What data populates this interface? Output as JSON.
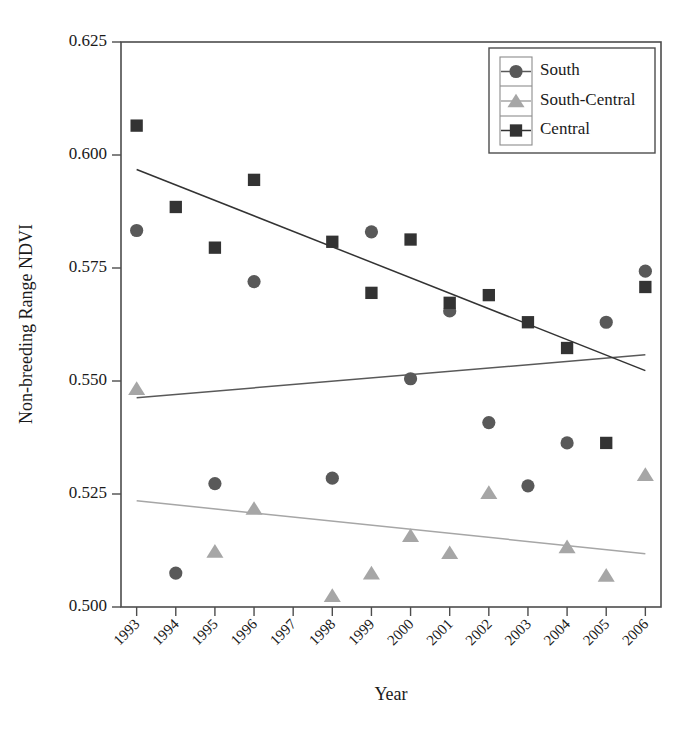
{
  "chart_data": {
    "type": "scatter",
    "title": "",
    "xlabel": "Year",
    "ylabel": "Non-breeding Range NDVI",
    "grid": false,
    "legend_position": "top-right",
    "x": [
      1993,
      1994,
      1995,
      1996,
      1997,
      1998,
      1999,
      2000,
      2001,
      2002,
      2003,
      2004,
      2005,
      2006
    ],
    "xtick_labels": [
      "1993",
      "1994",
      "1995",
      "1996",
      "1997",
      "1998",
      "1999",
      "2000",
      "2001",
      "2002",
      "2003",
      "2004",
      "2005",
      "2006"
    ],
    "xlim": [
      1992.6,
      2006.4
    ],
    "ylim": [
      0.5,
      0.625
    ],
    "ytick_values": [
      0.5,
      0.525,
      0.55,
      0.575,
      0.6,
      0.625
    ],
    "ytick_labels": [
      "0.500",
      "0.525",
      "0.550",
      "0.575",
      "0.600",
      "0.625"
    ],
    "series": [
      {
        "name": "South",
        "marker": "circle",
        "color": "#595959",
        "points": [
          {
            "x": 1993,
            "y": 0.5833
          },
          {
            "x": 1994,
            "y": 0.5075
          },
          {
            "x": 1995,
            "y": 0.5273
          },
          {
            "x": 1996,
            "y": 0.572
          },
          {
            "x": 1998,
            "y": 0.5285
          },
          {
            "x": 1999,
            "y": 0.583
          },
          {
            "x": 2000,
            "y": 0.5505
          },
          {
            "x": 2001,
            "y": 0.5655
          },
          {
            "x": 2002,
            "y": 0.5408
          },
          {
            "x": 2003,
            "y": 0.5268
          },
          {
            "x": 2004,
            "y": 0.5363
          },
          {
            "x": 2005,
            "y": 0.563
          },
          {
            "x": 2006,
            "y": 0.5743
          }
        ],
        "trend": {
          "x1": 1993,
          "y1": 0.5463,
          "x2": 2006,
          "y2": 0.5558
        }
      },
      {
        "name": "South-Central",
        "marker": "triangle",
        "color": "#a6a6a6",
        "points": [
          {
            "x": 1993,
            "y": 0.5483
          },
          {
            "x": 1995,
            "y": 0.5123
          },
          {
            "x": 1996,
            "y": 0.5218
          },
          {
            "x": 1998,
            "y": 0.5025
          },
          {
            "x": 1999,
            "y": 0.5075
          },
          {
            "x": 2000,
            "y": 0.5158
          },
          {
            "x": 2001,
            "y": 0.512
          },
          {
            "x": 2002,
            "y": 0.5253
          },
          {
            "x": 2004,
            "y": 0.5133
          },
          {
            "x": 2005,
            "y": 0.507
          },
          {
            "x": 2006,
            "y": 0.5293
          }
        ],
        "trend": {
          "x1": 1993,
          "y1": 0.5235,
          "x2": 2006,
          "y2": 0.5118
        }
      },
      {
        "name": "Central",
        "marker": "square",
        "color": "#333333",
        "points": [
          {
            "x": 1993,
            "y": 0.6065
          },
          {
            "x": 1994,
            "y": 0.5885
          },
          {
            "x": 1995,
            "y": 0.5795
          },
          {
            "x": 1996,
            "y": 0.5945
          },
          {
            "x": 1998,
            "y": 0.5808
          },
          {
            "x": 1999,
            "y": 0.5695
          },
          {
            "x": 2000,
            "y": 0.5813
          },
          {
            "x": 2001,
            "y": 0.5673
          },
          {
            "x": 2002,
            "y": 0.569
          },
          {
            "x": 2003,
            "y": 0.563
          },
          {
            "x": 2004,
            "y": 0.5573
          },
          {
            "x": 2005,
            "y": 0.5363
          },
          {
            "x": 2006,
            "y": 0.5708
          }
        ],
        "trend": {
          "x1": 1993,
          "y1": 0.5968,
          "x2": 2006,
          "y2": 0.5523
        }
      }
    ]
  },
  "legend": {
    "entries": [
      {
        "label": "South"
      },
      {
        "label": "South-Central"
      },
      {
        "label": "Central"
      }
    ]
  }
}
